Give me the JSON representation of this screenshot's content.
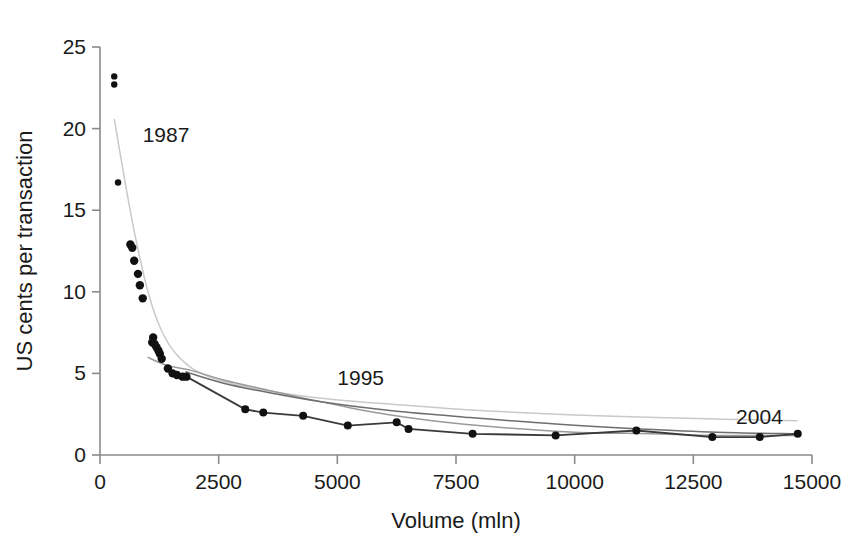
{
  "chart_data": {
    "type": "scatter",
    "title": "",
    "xlabel": "Volume (mln)",
    "ylabel": "US cents per transaction",
    "xlim": [
      0,
      15000
    ],
    "ylim": [
      0,
      25
    ],
    "xticks": [
      0,
      2500,
      5000,
      7500,
      10000,
      12500,
      15000
    ],
    "xticklabels": [
      "0",
      "2500",
      "5000",
      "7500",
      "10000",
      "12500",
      "15000"
    ],
    "yticks": [
      0,
      5,
      10,
      15,
      20,
      25
    ],
    "yticklabels": [
      "0",
      "5",
      "10",
      "15",
      "20",
      "25"
    ],
    "grid": false,
    "legend": "none",
    "annotations": [
      {
        "text": "1987",
        "x": 900,
        "y": 19.2
      },
      {
        "text": "1995",
        "x": 5000,
        "y": 4.3
      },
      {
        "text": "2004",
        "x": 13400,
        "y": 1.9
      }
    ],
    "points": [
      {
        "x": 300,
        "y": 23.2
      },
      {
        "x": 300,
        "y": 22.7
      },
      {
        "x": 380,
        "y": 16.7
      },
      {
        "x": 640,
        "y": 12.9
      },
      {
        "x": 680,
        "y": 12.7
      },
      {
        "x": 720,
        "y": 11.9
      },
      {
        "x": 800,
        "y": 11.1
      },
      {
        "x": 840,
        "y": 10.4
      },
      {
        "x": 900,
        "y": 9.6
      },
      {
        "x": 1120,
        "y": 7.2
      },
      {
        "x": 1100,
        "y": 6.9
      },
      {
        "x": 1150,
        "y": 6.8
      },
      {
        "x": 1190,
        "y": 6.6
      },
      {
        "x": 1230,
        "y": 6.4
      },
      {
        "x": 1260,
        "y": 6.2
      },
      {
        "x": 1300,
        "y": 5.9
      },
      {
        "x": 1430,
        "y": 5.3
      },
      {
        "x": 1530,
        "y": 5.0
      },
      {
        "x": 1620,
        "y": 4.9
      },
      {
        "x": 1740,
        "y": 4.8
      },
      {
        "x": 1820,
        "y": 4.8
      },
      {
        "x": 3060,
        "y": 2.8
      },
      {
        "x": 3440,
        "y": 2.6
      },
      {
        "x": 4280,
        "y": 2.4
      },
      {
        "x": 5220,
        "y": 1.8
      },
      {
        "x": 6250,
        "y": 2.0
      },
      {
        "x": 6500,
        "y": 1.6
      },
      {
        "x": 7850,
        "y": 1.3
      },
      {
        "x": 9600,
        "y": 1.2
      },
      {
        "x": 11300,
        "y": 1.5
      },
      {
        "x": 12900,
        "y": 1.1
      },
      {
        "x": 13900,
        "y": 1.1
      },
      {
        "x": 14700,
        "y": 1.3
      }
    ],
    "series": [
      {
        "name": "1987",
        "style": "fitted-curve",
        "color": "#c9c9c9",
        "points": [
          {
            "x": 300,
            "y": 20.6
          },
          {
            "x": 560,
            "y": 16.2
          },
          {
            "x": 800,
            "y": 12.6
          },
          {
            "x": 1050,
            "y": 9.6
          },
          {
            "x": 1300,
            "y": 7.6
          },
          {
            "x": 1600,
            "y": 6.2
          },
          {
            "x": 2000,
            "y": 5.2
          },
          {
            "x": 2600,
            "y": 4.5
          },
          {
            "x": 3400,
            "y": 4.0
          },
          {
            "x": 4600,
            "y": 3.5
          },
          {
            "x": 6200,
            "y": 3.1
          },
          {
            "x": 8200,
            "y": 2.7
          },
          {
            "x": 10500,
            "y": 2.4
          },
          {
            "x": 13000,
            "y": 2.2
          },
          {
            "x": 14700,
            "y": 2.1
          }
        ]
      },
      {
        "name": "1995",
        "style": "fitted-curve",
        "color": "#9a9a9a",
        "points": [
          {
            "x": 1000,
            "y": 6.0
          },
          {
            "x": 1400,
            "y": 5.5
          },
          {
            "x": 1900,
            "y": 5.2
          },
          {
            "x": 2600,
            "y": 4.6
          },
          {
            "x": 3500,
            "y": 4.0
          },
          {
            "x": 4600,
            "y": 3.3
          },
          {
            "x": 5800,
            "y": 2.6
          },
          {
            "x": 7000,
            "y": 2.1
          },
          {
            "x": 8400,
            "y": 1.7
          },
          {
            "x": 10000,
            "y": 1.4
          },
          {
            "x": 11600,
            "y": 1.3
          },
          {
            "x": 13200,
            "y": 1.2
          },
          {
            "x": 14700,
            "y": 1.2
          }
        ]
      },
      {
        "name": "2004",
        "style": "fitted-curve",
        "color": "#6e6e6e",
        "points": [
          {
            "x": 1800,
            "y": 5.1
          },
          {
            "x": 2600,
            "y": 4.4
          },
          {
            "x": 3600,
            "y": 3.8
          },
          {
            "x": 4800,
            "y": 3.2
          },
          {
            "x": 6200,
            "y": 2.7
          },
          {
            "x": 7800,
            "y": 2.3
          },
          {
            "x": 9600,
            "y": 1.9
          },
          {
            "x": 11400,
            "y": 1.6
          },
          {
            "x": 13000,
            "y": 1.4
          },
          {
            "x": 14700,
            "y": 1.3
          }
        ]
      },
      {
        "name": "observed-connector",
        "style": "connecting-line",
        "color": "#3a3a3a",
        "points": [
          {
            "x": 1820,
            "y": 4.8
          },
          {
            "x": 3060,
            "y": 2.8
          },
          {
            "x": 3440,
            "y": 2.6
          },
          {
            "x": 4280,
            "y": 2.4
          },
          {
            "x": 5220,
            "y": 1.8
          },
          {
            "x": 6250,
            "y": 2.0
          },
          {
            "x": 6500,
            "y": 1.6
          },
          {
            "x": 7850,
            "y": 1.3
          },
          {
            "x": 9600,
            "y": 1.2
          },
          {
            "x": 11300,
            "y": 1.5
          },
          {
            "x": 12900,
            "y": 1.1
          },
          {
            "x": 13900,
            "y": 1.1
          },
          {
            "x": 14700,
            "y": 1.3
          }
        ]
      }
    ]
  },
  "axes": {
    "x_title": "Volume (mln)",
    "y_title": "US cents per transaction"
  }
}
